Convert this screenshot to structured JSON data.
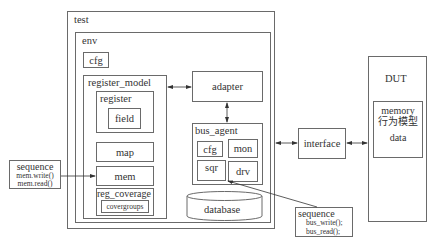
{
  "diagram": {
    "test": {
      "label": "test"
    },
    "env": {
      "label": "env",
      "cfg": "cfg",
      "register_model": {
        "label": "register_model",
        "register": {
          "label": "register",
          "field": "field"
        },
        "map": "map",
        "mem": "mem",
        "reg_coverage": {
          "label": "reg_coverage",
          "covergroups": "covergroups"
        }
      },
      "adapter": "adapter",
      "bus_agent": {
        "label": "bus_agent",
        "cfg": "cfg",
        "mon": "mon",
        "sqr": "sqr",
        "drv": "drv"
      },
      "database": "database"
    },
    "interface": "interface",
    "dut": {
      "label": "DUT",
      "memory": {
        "line1": "memory",
        "line2": "行为模型",
        "line3": "data"
      }
    },
    "sequence_left": {
      "title": "sequence",
      "line1": "mem.write()",
      "line2": "mem.read()"
    },
    "sequence_right": {
      "title": "sequence",
      "line1": "bus_write();",
      "line2": "bus_read();"
    }
  },
  "colors": {
    "stroke": "#6a6a6a",
    "text": "#333333",
    "background": "#ffffff"
  }
}
